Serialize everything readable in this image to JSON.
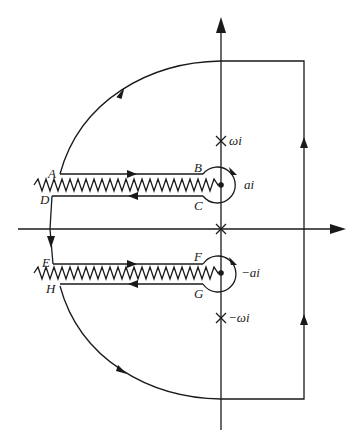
{
  "diagram": {
    "type": "complex-plane contour with branch cuts",
    "colors": {
      "stroke": "#1a1a1a",
      "background": "#ffffff"
    },
    "points": {
      "A": "A",
      "B": "B",
      "C": "C",
      "D": "D",
      "E": "E",
      "F": "F",
      "G": "G",
      "H": "H"
    },
    "singularities": {
      "omega_i": "ωi",
      "neg_omega_i": "−ωi",
      "a_i": "ai",
      "neg_a_i": "−ai"
    }
  }
}
